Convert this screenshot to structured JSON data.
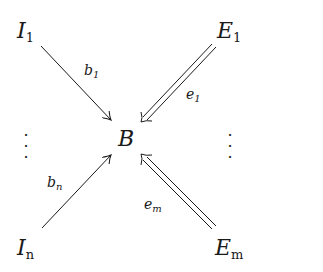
{
  "diagram": {
    "center": {
      "label": "B"
    },
    "sources_left": [
      {
        "label": "I",
        "sub": "1",
        "arrow_label": "b",
        "arrow_sub": "1",
        "arrow_style": "single"
      },
      {
        "label": "I",
        "sub": "n",
        "arrow_label": "b",
        "arrow_sub": "n",
        "arrow_style": "single"
      }
    ],
    "sources_right": [
      {
        "label": "E",
        "sub": "1",
        "arrow_label": "e",
        "arrow_sub": "1",
        "arrow_style": "double"
      },
      {
        "label": "E",
        "sub": "m",
        "arrow_label": "e",
        "arrow_sub": "m",
        "arrow_style": "double"
      }
    ],
    "ellipsis": "⋮",
    "ink_color": "#1a1a1a",
    "background": "#ffffff"
  }
}
